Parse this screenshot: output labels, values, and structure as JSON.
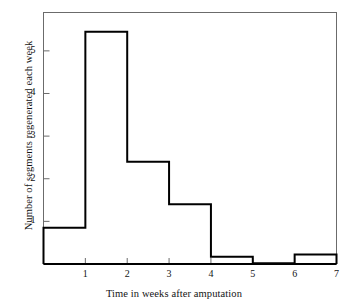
{
  "chart_data": {
    "type": "bar",
    "title": "",
    "subtitle": "",
    "xlabel": "Time in weeks after amputation",
    "ylabel": "Number of segments regenerated each week",
    "bin_edges": [
      0,
      1,
      2,
      3,
      4,
      5,
      6,
      7
    ],
    "categories": [
      "0-1",
      "1-2",
      "2-3",
      "3-4",
      "4-5",
      "5-6",
      "6-7"
    ],
    "values": [
      0.85,
      5.45,
      2.4,
      1.4,
      0.17,
      0.02,
      0.22
    ],
    "xlim": [
      0,
      7
    ],
    "ylim": [
      0,
      5.9
    ],
    "xticks": [
      1,
      2,
      3,
      4,
      5,
      6,
      7
    ],
    "xtick_labels": [
      "1",
      "2",
      "3",
      "4",
      "5",
      "6",
      "7"
    ],
    "yticks": [
      1,
      2,
      3,
      4,
      5
    ],
    "ytick_labels": [
      "1",
      "2",
      "3",
      "4",
      "5"
    ],
    "grid": false,
    "legend": null,
    "bar_fill": "#ffffff",
    "bar_edge_color": "#000000",
    "axis_color": "#6b6b6b",
    "background": "#ffffff"
  },
  "axis": {
    "x_label": "Time in weeks after amputation",
    "y_label": "Number of segments regenerated each week"
  }
}
